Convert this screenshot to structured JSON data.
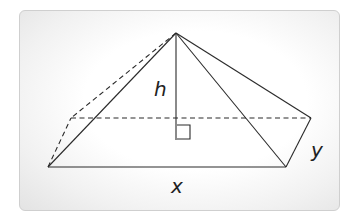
{
  "diagram": {
    "labels": {
      "height": "h",
      "length": "x",
      "width": "y"
    },
    "vertices": {
      "apex": [
        176,
        33
      ],
      "front_left": [
        48,
        167
      ],
      "front_right": [
        286,
        167
      ],
      "back_right": [
        311,
        118
      ],
      "back_left": [
        71,
        118
      ],
      "height_foot": [
        176,
        118
      ]
    },
    "right_angle_marker": true,
    "colors": {
      "line": "#2a2a2a",
      "label": "#222222",
      "card_border": "#cfcfcf"
    }
  }
}
